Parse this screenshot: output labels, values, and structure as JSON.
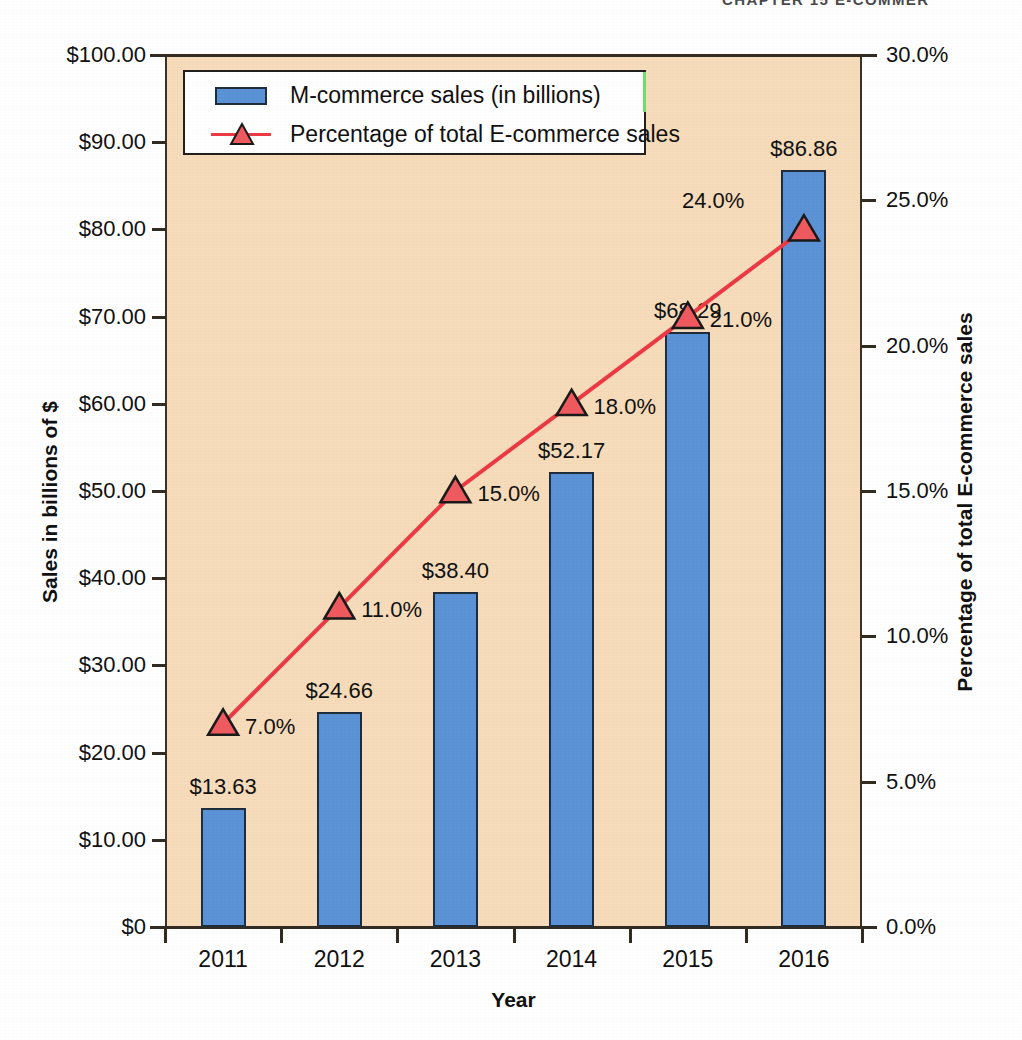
{
  "page": {
    "running_head": "CHAPTER 15     E-COMMER"
  },
  "legend": {
    "items": [
      {
        "label": "M-commerce sales (in billions)",
        "marker": "bar-swatch",
        "color": "#5B93D6"
      },
      {
        "label": "Percentage of total E-commerce sales",
        "marker": "triangle-line-swatch",
        "color": "#EC3A45"
      }
    ]
  },
  "axes": {
    "x_title": "Year",
    "y_left_title": "Sales in billions of $",
    "y_right_title": "Percentage of total E-commerce sales",
    "y_left_ticks": [
      "$0",
      "$10.00",
      "$20.00",
      "$30.00",
      "$40.00",
      "$50.00",
      "$60.00",
      "$70.00",
      "$80.00",
      "$90.00",
      "$100.00"
    ],
    "y_right_ticks": [
      "0.0%",
      "5.0%",
      "10.0%",
      "15.0%",
      "20.0%",
      "25.0%",
      "30.0%"
    ]
  },
  "chart_data": {
    "type": "bar",
    "title": "",
    "subtitle": "",
    "xlabel": "Year",
    "ylabel": "Sales in billions of $",
    "y2label": "Percentage of total E-commerce sales",
    "categories": [
      "2011",
      "2012",
      "2013",
      "2014",
      "2015",
      "2016"
    ],
    "ylim": [
      0,
      100
    ],
    "y2lim": [
      0,
      30
    ],
    "ytick_values": [
      0,
      10,
      20,
      30,
      40,
      50,
      60,
      70,
      80,
      90,
      100
    ],
    "y2tick_values": [
      0,
      5,
      10,
      15,
      20,
      25,
      30
    ],
    "grid": false,
    "legend_position": "top-left",
    "plot_background": "#F7DCBB",
    "series": [
      {
        "name": "M-commerce sales (in billions)",
        "type": "bar",
        "axis": "left",
        "color": "#5B93D6",
        "values": [
          13.63,
          24.66,
          38.4,
          52.17,
          68.29,
          86.86
        ],
        "data_labels": [
          "$13.63",
          "$24.66",
          "$38.40",
          "$52.17",
          "$68.29",
          "$86.86"
        ]
      },
      {
        "name": "Percentage of total E-commerce sales",
        "type": "line",
        "axis": "right",
        "color": "#EC3A45",
        "marker": "triangle",
        "values": [
          7.0,
          11.0,
          15.0,
          18.0,
          21.0,
          24.0
        ],
        "data_labels": [
          "7.0%",
          "11.0%",
          "15.0%",
          "18.0%",
          "21.0%",
          "24.0%"
        ]
      }
    ]
  }
}
